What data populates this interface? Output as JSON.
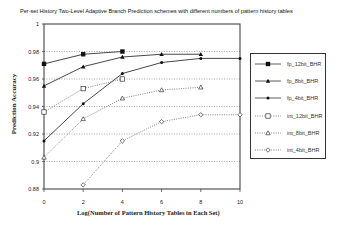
{
  "chart_data": {
    "type": "line",
    "title": "Per-set History Two-Level Adaptive Branch Prediction schemes with different numbers of pattern history tables",
    "xlabel": "Log(Number of Pattern History Tables in Each Set)",
    "ylabel": "Prediction Accuracy",
    "xlim": [
      0,
      10
    ],
    "ylim": [
      0.88,
      1
    ],
    "xticks": [
      "0",
      "2",
      "4",
      "6",
      "8",
      "10"
    ],
    "yticks": [
      "0.88",
      "0.9",
      "0.92",
      "0.94",
      "0.96",
      "0.98",
      "1"
    ],
    "grid": "horizontal dotted",
    "legend_position": "right",
    "series": [
      {
        "name": "fp_12bit_BHR",
        "style": "solid",
        "marker": "filled-square",
        "x": [
          0,
          2,
          4
        ],
        "values": [
          0.971,
          0.978,
          0.98
        ]
      },
      {
        "name": "fp_8bit_BHR",
        "style": "solid",
        "marker": "filled-triangle",
        "x": [
          0,
          2,
          4,
          6,
          8
        ],
        "values": [
          0.955,
          0.969,
          0.976,
          0.978,
          0.978
        ]
      },
      {
        "name": "fp_4bit_BHR",
        "style": "solid",
        "marker": "filled-dot",
        "x": [
          0,
          2,
          4,
          6,
          8,
          10
        ],
        "values": [
          0.915,
          0.942,
          0.964,
          0.972,
          0.975,
          0.975
        ]
      },
      {
        "name": "int_12bit_BHR",
        "style": "dotted",
        "marker": "open-square",
        "x": [
          0,
          2,
          4
        ],
        "values": [
          0.936,
          0.953,
          0.96
        ]
      },
      {
        "name": "int_8bit_BHR",
        "style": "dotted",
        "marker": "open-triangle",
        "x": [
          0,
          2,
          4,
          6,
          8
        ],
        "values": [
          0.903,
          0.931,
          0.946,
          0.952,
          0.954
        ]
      },
      {
        "name": "int_4bit_BHR",
        "style": "dotted",
        "marker": "open-diamond",
        "x": [
          2,
          4,
          6,
          8,
          10
        ],
        "values": [
          0.883,
          0.915,
          0.929,
          0.934,
          0.934
        ]
      }
    ]
  }
}
